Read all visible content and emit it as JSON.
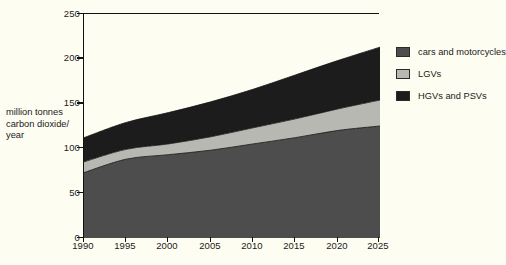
{
  "chart_data": {
    "type": "area",
    "stacked": true,
    "title": "",
    "xlabel": "",
    "ylabel": "million tonnes\ncarbon dioxide/\nyear",
    "x": [
      1990,
      1995,
      2000,
      2005,
      2010,
      2015,
      2020,
      2025
    ],
    "xticklabels": [
      "1990",
      "1995",
      "2000",
      "2005",
      "2010",
      "2015",
      "2020",
      "2025"
    ],
    "yticks": [
      0,
      50,
      100,
      150,
      200,
      250
    ],
    "yticklabels": [
      "0",
      "50",
      "100",
      "150",
      "200",
      "250"
    ],
    "xlim": [
      1990,
      2025
    ],
    "ylim": [
      0,
      250
    ],
    "grid": false,
    "legend_position": "right",
    "series": [
      {
        "name": "cars and motorcycles",
        "color": "#4d4d4d",
        "values": [
          73,
          88,
          93,
          98,
          105,
          112,
          120,
          125
        ]
      },
      {
        "name": "LGVs",
        "color": "#b8b8b3",
        "values": [
          12,
          11,
          12,
          15,
          18,
          21,
          24,
          29
        ]
      },
      {
        "name": "HGVs and PSVs",
        "color": "#1c1c1c",
        "values": [
          27,
          30,
          35,
          39,
          43,
          49,
          54,
          59
        ]
      }
    ],
    "cumulative_totals": [
      112,
      129,
      140,
      152,
      166,
      182,
      198,
      213
    ],
    "cumulative_cars_plus_lgv": [
      85,
      99,
      105,
      113,
      123,
      133,
      144,
      154
    ]
  },
  "legend": {
    "items": [
      {
        "label": "cars and motorcycles",
        "color": "#4d4d4d"
      },
      {
        "label": "LGVs",
        "color": "#b8b8b3"
      },
      {
        "label": "HGVs and PSVs",
        "color": "#1c1c1c"
      }
    ]
  },
  "axis": {
    "y_title": "million tonnes\ncarbon dioxide/\nyear",
    "y_labels": [
      "250",
      "200",
      "150",
      "100",
      "50",
      "0"
    ],
    "x_labels": [
      "1990",
      "1995",
      "2000",
      "2005",
      "2010",
      "2015",
      "2020",
      "2025"
    ]
  },
  "colors": {
    "background": "#fdfdf2",
    "axis": "#111111",
    "text": "#1a1a1a",
    "cars": "#4d4d4d",
    "lgvs": "#b8b8b3",
    "hgvs": "#1c1c1c"
  }
}
